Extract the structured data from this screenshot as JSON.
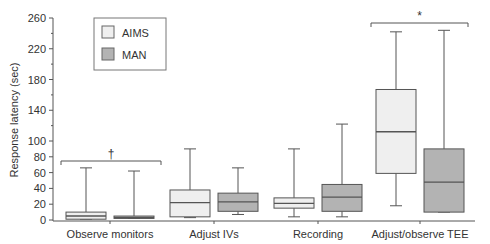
{
  "chart_data": {
    "type": "box",
    "title": "",
    "xlabel": "",
    "ylabel": "Response latency (sec)",
    "ylim": [
      0,
      260
    ],
    "y_scale": "broken: 0-100 in steps of 20 (expanded), 100-260 in steps of 40 (compressed)",
    "y_ticks": [
      0,
      20,
      40,
      60,
      80,
      100,
      140,
      180,
      220,
      260
    ],
    "categories": [
      "Observe monitors",
      "Adjust IVs",
      "Recording",
      "Adjust/observe TEE"
    ],
    "legend": {
      "position": "upper-left",
      "entries": [
        "AIMS",
        "MAN"
      ]
    },
    "series": [
      {
        "name": "AIMS",
        "color": "#efefef",
        "boxes": [
          {
            "whisker_low": 1,
            "q1": 1,
            "median": 5,
            "q3": 10,
            "whisker_high": 66
          },
          {
            "whisker_low": 3,
            "q1": 4,
            "median": 22,
            "q3": 38,
            "whisker_high": 90
          },
          {
            "whisker_low": 4,
            "q1": 15,
            "median": 21,
            "q3": 28,
            "whisker_high": 90
          },
          {
            "whisker_low": 18,
            "q1": 59,
            "median": 112,
            "q3": 167,
            "whisker_high": 242
          }
        ]
      },
      {
        "name": "MAN",
        "color": "#b3b3b3",
        "boxes": [
          {
            "whisker_low": 2,
            "q1": 2,
            "median": 3,
            "q3": 5,
            "whisker_high": 62
          },
          {
            "whisker_low": 7,
            "q1": 11,
            "median": 23,
            "q3": 34,
            "whisker_high": 66
          },
          {
            "whisker_low": 4,
            "q1": 11,
            "median": 29,
            "q3": 45,
            "whisker_high": 122
          },
          {
            "whisker_low": 10,
            "q1": 10,
            "median": 48,
            "q3": 90,
            "whisker_high": 244
          }
        ]
      }
    ],
    "annotations": [
      {
        "text": "†",
        "group": "Observe monitors",
        "type": "significance-bracket"
      },
      {
        "text": "*",
        "group": "Adjust/observe TEE",
        "type": "significance-bracket"
      }
    ],
    "grid": false
  }
}
